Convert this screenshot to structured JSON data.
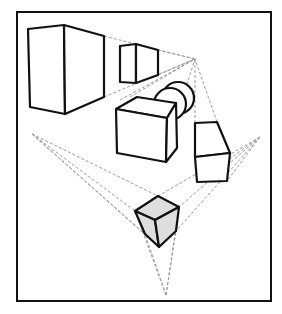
{
  "diagram": {
    "title": "",
    "colors": {
      "background": "#ffffff",
      "edge": "#111111",
      "guide": "#9a9a9a",
      "shaded_face": "#dedede"
    },
    "frame": {
      "x": 17,
      "y": 12,
      "width": 254,
      "height": 289
    },
    "vanishing_points": [
      {
        "id": "vp-top",
        "x": 195,
        "y": 59
      },
      {
        "id": "vp-left",
        "x": 32,
        "y": 134
      },
      {
        "id": "vp-right",
        "x": 260,
        "y": 137
      },
      {
        "id": "vp-bottom",
        "x": 166,
        "y": 295
      }
    ],
    "shapes": [
      {
        "id": "large-box",
        "type": "box"
      },
      {
        "id": "small-box",
        "type": "box"
      },
      {
        "id": "cylinder",
        "type": "cylinder"
      },
      {
        "id": "middle-box",
        "type": "box"
      },
      {
        "id": "right-box",
        "type": "box"
      },
      {
        "id": "shaded-cube",
        "type": "cube",
        "shaded": true
      }
    ]
  }
}
